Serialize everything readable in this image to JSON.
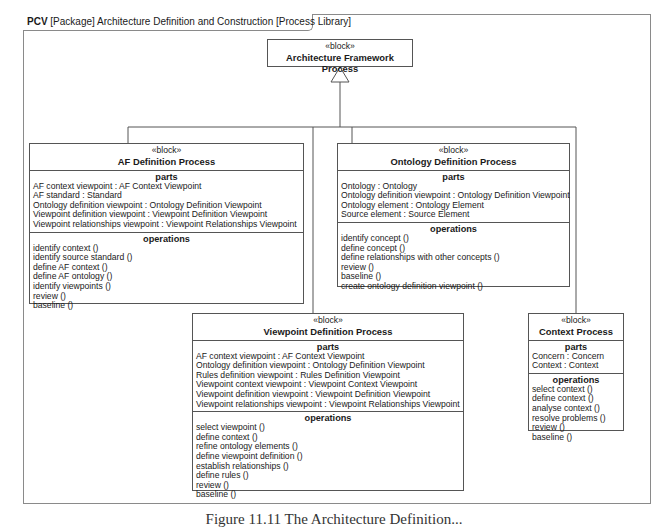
{
  "frame": {
    "kind": "PCV",
    "title": "[Package] Architecture Definition and Construction [Process Library]"
  },
  "stereotype": "«block»",
  "parts_label": "parts",
  "operations_label": "operations",
  "blocks": {
    "root": {
      "name": "Architecture Framework Process"
    },
    "af": {
      "name": "AF Definition Process",
      "parts": [
        "AF context viewpoint : AF Context Viewpoint",
        "AF standard : Standard",
        "Ontology definition viewpoint : Ontology Definition Viewpoint",
        "Viewpoint definition viewpoint : Viewpoint Definition Viewpoint",
        "Viewpoint relationships viewpoint : Viewpoint Relationships Viewpoint"
      ],
      "operations": [
        "identify context ()",
        "identify source standard ()",
        "define AF context ()",
        "define AF ontology ()",
        "identify viewpoints ()",
        "review ()",
        "baseline ()"
      ]
    },
    "ontology": {
      "name": "Ontology Definition Process",
      "parts": [
        "Ontology : Ontology",
        "Ontology definition viewpoint : Ontology Definition Viewpoint",
        "Ontology element : Ontology Element",
        "Source element : Source Element"
      ],
      "operations": [
        "identify concept ()",
        "define concept ()",
        "define relationships with other concepts ()",
        "review ()",
        "baseline ()",
        "create ontology definition viewpoint ()"
      ]
    },
    "viewpoint": {
      "name": "Viewpoint Definition Process",
      "parts": [
        "AF context viewpoint : AF Context Viewpoint",
        "Ontology definition viewpoint : Ontology Definition Viewpoint",
        "Rules definition viewpoint : Rules Definition Viewpoint",
        "Viewpoint context viewpoint : Viewpoint Context Viewpoint",
        "Viewpoint definition viewpoint : Viewpoint Definition Viewpoint",
        "Viewpoint relationships viewpoint : Viewpoint Relationships Viewpoint"
      ],
      "operations": [
        "select viewpoint ()",
        "define context ()",
        "refine ontology elements ()",
        "define viewpoint definition ()",
        "establish relationships ()",
        "define rules ()",
        "review ()",
        "baseline ()"
      ]
    },
    "context": {
      "name": "Context Process",
      "parts": [
        "Concern : Concern",
        "Context : Context"
      ],
      "operations": [
        "select context ()",
        "define context ()",
        "analyse context ()",
        "resolve problems ()",
        "review ()",
        "baseline ()"
      ]
    }
  },
  "caption": "Figure 11.11   The Architecture Definition..."
}
